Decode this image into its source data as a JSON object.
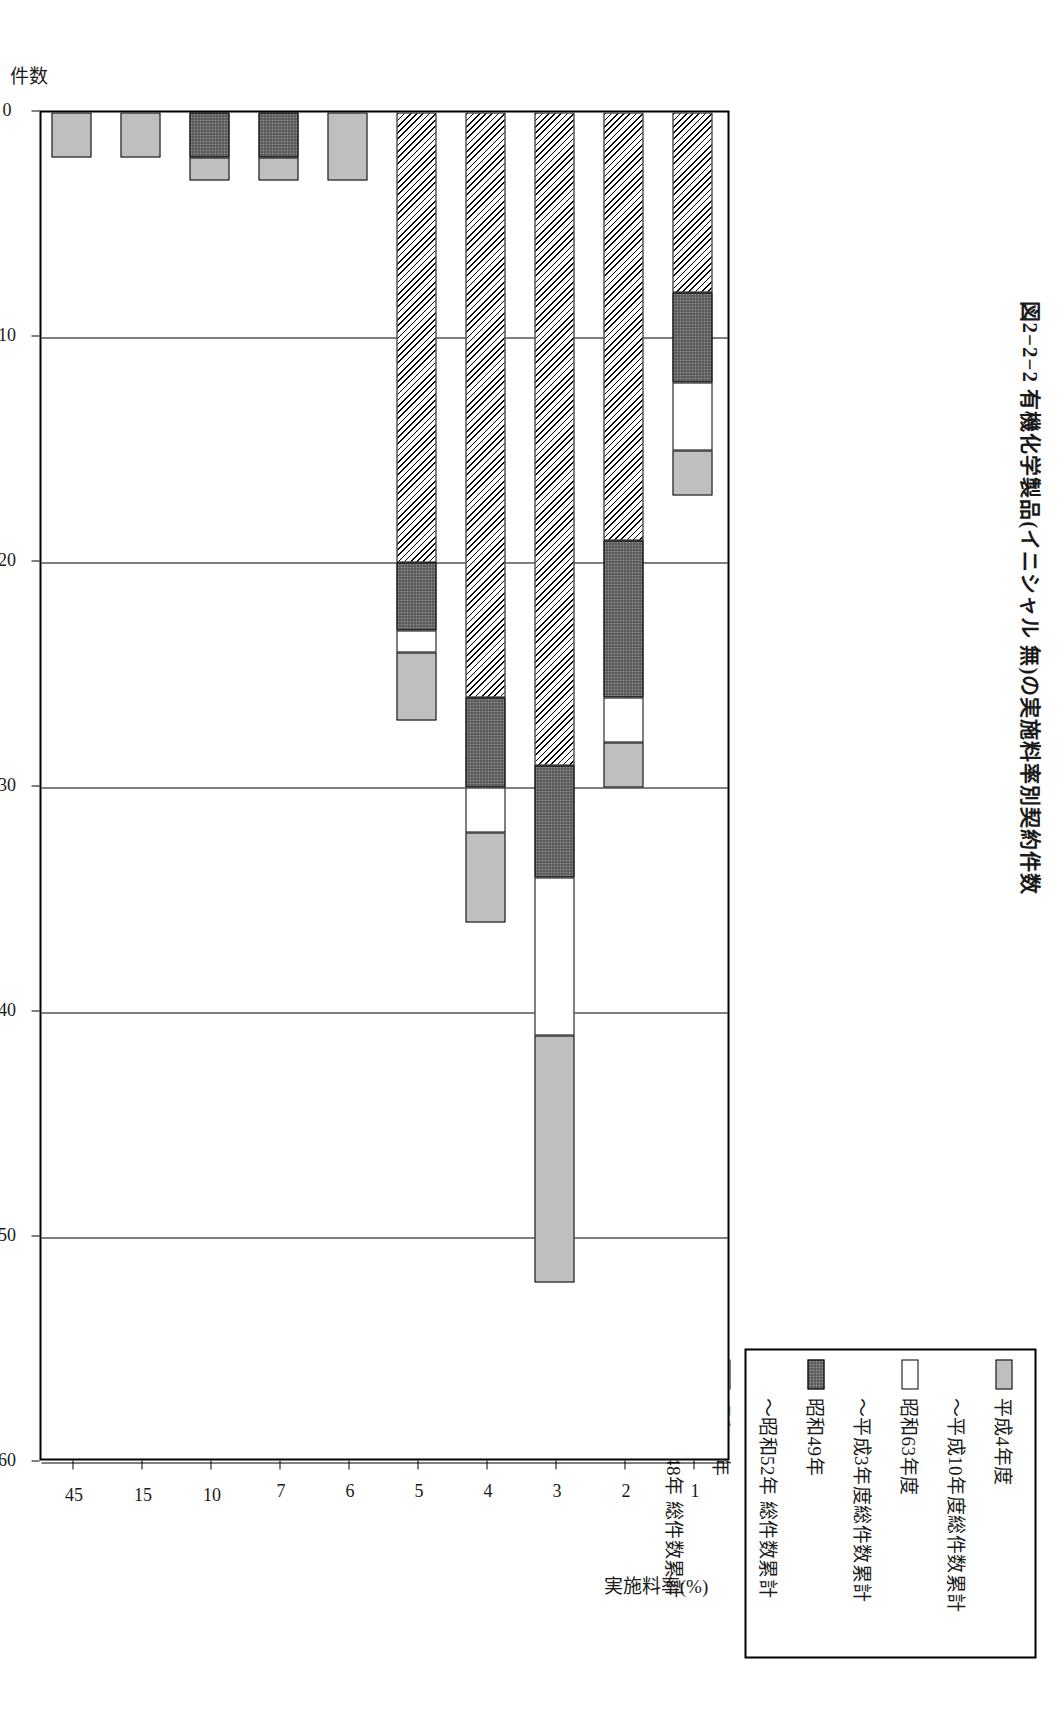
{
  "figure": {
    "title": "図2−2−2  有機化学製品(イニシャル 無)の実施料率別契約件数"
  },
  "legend": {
    "entries": [
      {
        "label": "平成4年度",
        "swatch": "gray-solid"
      },
      {
        "label": "〜平成10年度総件数累計",
        "swatch": "none"
      },
      {
        "label": "昭和63年度",
        "swatch": "white-blank"
      },
      {
        "label": "〜平成3年度総件数累計",
        "swatch": "none"
      },
      {
        "label": "昭和49年",
        "swatch": "dark-dotted"
      },
      {
        "label": "〜昭和52年 総件数累計",
        "swatch": "none"
      },
      {
        "label": "昭和43年",
        "swatch": "diagonal-hatch"
      },
      {
        "label": "〜昭和48年 総件数累計",
        "swatch": "none"
      }
    ]
  },
  "axes": {
    "value_axis_title": "件数",
    "value_axis_ticks": [
      "0",
      "10",
      "20",
      "30",
      "40",
      "50",
      "60"
    ],
    "value_axis_min": 0,
    "value_axis_max": 60,
    "category_axis_title": "実施料率(%)"
  },
  "chart_data": {
    "type": "bar",
    "orientation": "horizontal",
    "stacked": true,
    "title": "図2−2−2  有機化学製品(イニシャル 無)の実施料率別契約件数",
    "xlabel": "件数",
    "ylabel": "実施料率(%)",
    "xlim": [
      0,
      60
    ],
    "grid": true,
    "legend_position": "top-right",
    "categories": [
      "1",
      "2",
      "3",
      "4",
      "5",
      "6",
      "7",
      "10",
      "15",
      "45"
    ],
    "series": [
      {
        "name": "昭和43年〜昭和48年 総件数累計",
        "pattern": "diagonal-hatch",
        "values": [
          8,
          19,
          29,
          26,
          20,
          0,
          0,
          0,
          0,
          0
        ]
      },
      {
        "name": "昭和49年〜昭和52年 総件数累計",
        "pattern": "dark-dotted",
        "values": [
          4,
          7,
          5,
          4,
          3,
          0,
          2,
          2,
          0,
          0
        ]
      },
      {
        "name": "昭和63年〜平成3年度総件数累計",
        "pattern": "white-blank",
        "values": [
          3,
          2,
          7,
          2,
          1,
          0,
          0,
          0,
          0,
          0
        ]
      },
      {
        "name": "平成4年度〜平成10年度総件数累計",
        "pattern": "gray-solid",
        "values": [
          2,
          2,
          11,
          4,
          3,
          3,
          1,
          1,
          2,
          2
        ]
      }
    ],
    "totals": [
      17,
      30,
      52,
      36,
      27,
      3,
      3,
      3,
      2,
      2
    ]
  }
}
